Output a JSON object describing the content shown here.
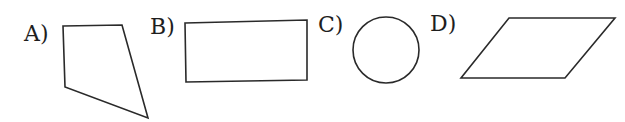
{
  "figure": {
    "options": [
      {
        "label": "A)",
        "shape": "irregular-quadrilateral",
        "points": [
          [
            63,
            26
          ],
          [
            122,
            25
          ],
          [
            148,
            118
          ],
          [
            65,
            87
          ]
        ]
      },
      {
        "label": "B)",
        "shape": "rectangle",
        "points": [
          [
            185,
            23
          ],
          [
            307,
            20
          ],
          [
            307,
            80
          ],
          [
            186,
            82
          ]
        ]
      },
      {
        "label": "C)",
        "shape": "circle",
        "center": [
          386,
          50
        ],
        "radius": 33
      },
      {
        "label": "D)",
        "shape": "parallelogram",
        "points": [
          [
            509,
            18
          ],
          [
            615,
            18
          ],
          [
            565,
            78
          ],
          [
            461,
            78
          ]
        ]
      }
    ],
    "colors": {
      "stroke": "#2a2a2a",
      "text": "#1e1e1e",
      "background": "#ffffff"
    }
  }
}
